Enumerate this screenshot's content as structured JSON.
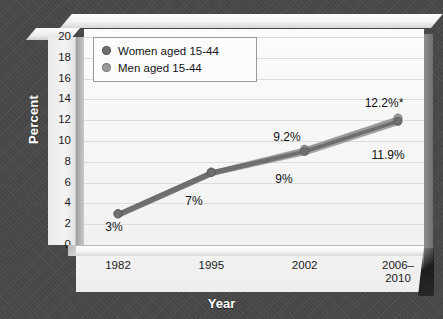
{
  "axis": {
    "y_title": "Percent",
    "x_title": "Year",
    "y_ticks": [
      "20",
      "18",
      "16",
      "14",
      "12",
      "10",
      "8",
      "6",
      "4",
      "2",
      "0"
    ],
    "x_ticks": [
      "1982",
      "1995",
      "2002",
      "2006–\n2010"
    ]
  },
  "legend": {
    "items": [
      {
        "label": "Women aged 15-44",
        "color": "#6e6e6e"
      },
      {
        "label": "Men aged 15-44",
        "color": "#9a9a9a"
      }
    ]
  },
  "labels": {
    "p1982": "3%",
    "p1995": "7%",
    "men2002": "9.2%",
    "women2002": "9%",
    "men2010": "12.2%*",
    "women2010": "11.9%"
  },
  "chart_data": {
    "type": "line",
    "title": "",
    "xlabel": "Year",
    "ylabel": "Percent",
    "categories": [
      "1982",
      "1995",
      "2002",
      "2006–2010"
    ],
    "ylim": [
      0,
      20
    ],
    "ytick_step": 2,
    "grid": true,
    "legend_position": "top-left",
    "series": [
      {
        "name": "Women aged 15-44",
        "color": "#6e6e6e",
        "values": [
          3,
          7,
          9,
          11.9
        ],
        "point_labels": [
          "3%",
          "7%",
          "9%",
          "11.9%"
        ]
      },
      {
        "name": "Men aged 15-44",
        "color": "#9a9a9a",
        "values": [
          3,
          7,
          9.2,
          12.2
        ],
        "point_labels": [
          "3%",
          "7%",
          "9.2%",
          "12.2%*"
        ]
      }
    ],
    "annotations": [
      "* indicates footnote marker on 12.2% value"
    ]
  }
}
